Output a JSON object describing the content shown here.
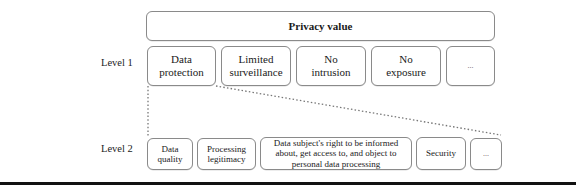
{
  "diagram": {
    "root": {
      "label": "Privacy value"
    },
    "levels": [
      {
        "label": "Level 1"
      },
      {
        "label": "Level 2"
      }
    ],
    "level1": [
      {
        "label": "Data\nprotection"
      },
      {
        "label": "Limited\nsurveillance"
      },
      {
        "label": "No\nintrusion"
      },
      {
        "label": "No\nexposure"
      },
      {
        "label": "..."
      }
    ],
    "level2": [
      {
        "label": "Data\nquality"
      },
      {
        "label": "Processing\nlegitimacy"
      },
      {
        "label": "Data subject's right to be informed\nabout, get access to, and object to\npersonal data processing"
      },
      {
        "label": "Security"
      },
      {
        "label": "..."
      }
    ],
    "expanded_from": "Data protection"
  },
  "colors": {
    "box_border": "#8a8a8a",
    "connector": "#777777",
    "rule": "#111111",
    "text": "#1a1a1a"
  }
}
